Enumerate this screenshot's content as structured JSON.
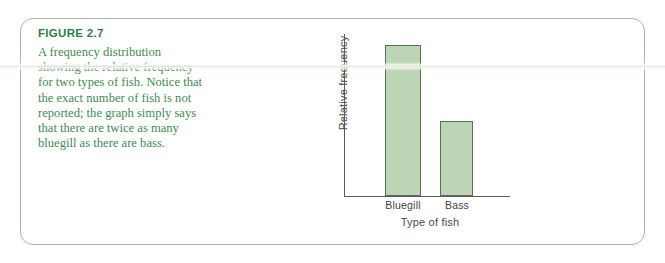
{
  "figure": {
    "label": "FIGURE 2.7",
    "caption": "A frequency distribution showing the relative frequency for two types of fish. Notice that the exact number of fish is not reported; the graph simply says that there are twice as many bluegill as there are bass.",
    "label_color": "#2f7d46",
    "caption_color": "#3f8a53",
    "border_color": "#aab5a8"
  },
  "chart_data": {
    "type": "bar",
    "title": "",
    "categories": [
      "Bluegill",
      "Bass"
    ],
    "values": [
      2,
      1
    ],
    "xlabel": "Type of fish",
    "ylabel": "Relative frequency",
    "ylim": [
      0,
      2.15
    ],
    "grid": false,
    "legend": "none",
    "axis_ticks": "none",
    "bar_fill": "#bcd5b4",
    "bar_stroke": "#5f6b5c",
    "axis_color": "#5a5a5a",
    "note": "Bluegill bar is exactly twice the height of the Bass bar; y-axis has no numeric scale."
  }
}
